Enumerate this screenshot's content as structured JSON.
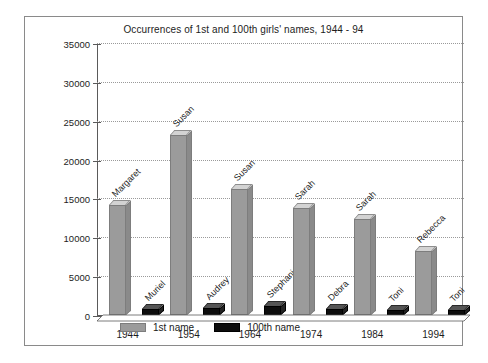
{
  "chart_data": {
    "type": "bar",
    "title": "Occurrences of 1st and 100th girls' names, 1944 - 94",
    "xlabel": "",
    "ylabel": "",
    "ylim": [
      0,
      35000
    ],
    "ytick_interval": 5000,
    "yticks": [
      "35000",
      "30000",
      "25000",
      "20000",
      "15000",
      "10000",
      "5000",
      "0"
    ],
    "grid": true,
    "legend_position": "bottom-left",
    "categories": [
      "1944",
      "1954",
      "1964",
      "1974",
      "1984",
      "1994"
    ],
    "series": [
      {
        "name": "1st name",
        "color": "#9b9b9b",
        "values": [
          14200,
          23200,
          16200,
          13800,
          12300,
          8200
        ],
        "point_labels": [
          "Margaret",
          "Susan",
          "Susan",
          "Sarah",
          "Sarah",
          "Rebecca"
        ]
      },
      {
        "name": "100th name",
        "color": "#0d0d0d",
        "values": [
          800,
          900,
          1100,
          750,
          700,
          700
        ],
        "point_labels": [
          "Muriel",
          "Audrey",
          "Stephanie",
          "Debra",
          "Toni",
          "Toni"
        ]
      }
    ]
  },
  "legend": {
    "items": [
      {
        "label": "1st name"
      },
      {
        "label": "100th name"
      }
    ]
  }
}
